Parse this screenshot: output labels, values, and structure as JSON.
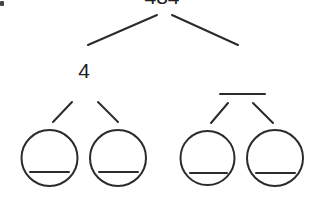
{
  "diagram": {
    "type": "number-bond-tree",
    "root": {
      "value": "484"
    },
    "level1": [
      {
        "value": "4"
      },
      {
        "value": ""
      }
    ],
    "level2": [
      {
        "parent": 0,
        "value": ""
      },
      {
        "parent": 0,
        "value": ""
      },
      {
        "parent": 1,
        "value": ""
      },
      {
        "parent": 1,
        "value": ""
      }
    ],
    "stroke_color": "#2b2b2b"
  }
}
